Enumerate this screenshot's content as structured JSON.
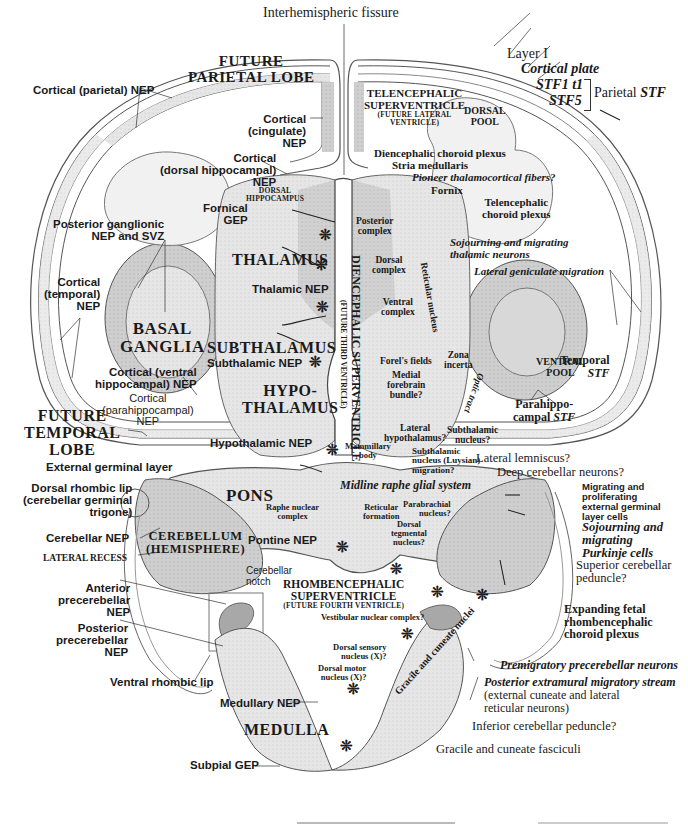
{
  "figure": {
    "top_label": "Interhemispheric fissure",
    "regions": {
      "future_parietal_lobe": [
        "FUTURE",
        "PARIETAL LOBE"
      ],
      "future_temporal_lobe": [
        "FUTURE",
        "TEMPORAL",
        "LOBE"
      ],
      "telencephalic_superventricle": [
        "TELENCEPHALIC",
        "SUPERVENTRICLE",
        "(FUTURE LATERAL",
        "VENTRICLE)"
      ],
      "dorsal_pool": [
        "DORSAL",
        "POOL"
      ],
      "ventral_pool": [
        "VENTRAL",
        "POOL"
      ],
      "dorsal_hippocampus": [
        "DORSAL",
        "HIPPOCAMPUS"
      ],
      "thalamus": "THALAMUS",
      "subthalamus": "SUBTHALAMUS",
      "hypothalamus": [
        "HYPO-",
        "THALAMUS"
      ],
      "basal_ganglia": [
        "BASAL",
        "GANGLIA"
      ],
      "diencephalic_superventricle": [
        "DIENCEPHALIC SUPERVENTRICLE",
        "(FUTURE THIRD VENTRICLE)"
      ],
      "pons": "PONS",
      "cerebellum": [
        "CEREBELLUM",
        "(HEMISPHERE)"
      ],
      "rhombencephalic_superventricle": [
        "RHOMBENCEPHALIC",
        "SUPERVENTRICLE",
        "(FUTURE FOURTH VENTRICLE)"
      ],
      "medulla": "MEDULLA"
    },
    "left_labels": {
      "cortical_parietal_nep": "Cortical (parietal) NEP",
      "cortical_cingulate_nep": [
        "Cortical",
        "(cingulate)",
        "NEP"
      ],
      "cortical_dorsal_hippocampal_nep": [
        "Cortical",
        "(dorsal hippocampal)",
        "NEP"
      ],
      "fornical_gep": [
        "Fornical",
        "GEP"
      ],
      "posterior_ganglionic": [
        "Posterior ganglionic",
        "NEP and SVZ"
      ],
      "cortical_temporal_nep": [
        "Cortical",
        "(temporal)",
        "NEP"
      ],
      "thalamic_nep": "Thalamic NEP",
      "subthalamic_nep": "Subthalamic NEP",
      "cortical_ventral_hippocampal_nep": [
        "Cortical (ventral",
        "hippocampal) NEP"
      ],
      "cortical_parahippocampal_nep": [
        "Cortical",
        "(parahippocampal)",
        "NEP"
      ],
      "hypothalamic_nep": "Hypothalamic NEP",
      "external_germinal_layer": "External germinal layer",
      "dorsal_rhombic_lip": [
        "Dorsal rhombic lip",
        "(cerebellar germinal",
        "trigone)"
      ],
      "cerebellar_nep": "Cerebellar NEP",
      "lateral_recess": "LATERAL RECESS",
      "anterior_precerebellar_nep": [
        "Anterior",
        "precerebellar",
        "NEP"
      ],
      "posterior_precerebellar_nep": [
        "Posterior",
        "precerebellar",
        "NEP"
      ],
      "ventral_rhombic_lip": "Ventral rhombic lip",
      "medullary_nep": "Medullary NEP",
      "subpial_gep": "Subpial GEP",
      "pontine_nep": "Pontine NEP",
      "cerebellar_notch": [
        "Cerebellar",
        "notch"
      ]
    },
    "right_labels": {
      "layer_i": "Layer I",
      "cortical_plate": "Cortical plate",
      "stf1_t1": "STF1 t1",
      "stf5": "STF5",
      "parietal_stf_prefix": "Parietal ",
      "parietal_stf_suffix": "STF",
      "diencephalic_choroid_plexus": "Diencephalic choroid plexus",
      "stria_medullaris": "Stria medullaris",
      "pioneer_fibers": "Pioneer thalamocortical fibers?",
      "fornix": "Fornix",
      "telencephalic_choroid_plexus": [
        "Telencephalic",
        "choroid plexus"
      ],
      "posterior_complex": [
        "Posterior",
        "complex"
      ],
      "dorsal_complex": [
        "Dorsal",
        "complex"
      ],
      "ventral_complex": [
        "Ventral",
        "complex"
      ],
      "reticular_nucleus": "Reticular nucleus",
      "sojourning_thalamic": [
        "Sojourning and migrating",
        "thalamic neurons"
      ],
      "lateral_geniculate_migration": "Lateral geniculate migration",
      "forels_fields": "Forel's fields",
      "zona_incerta": [
        "Zona",
        "incerta"
      ],
      "optic_tract": "Optic tract",
      "medial_forebrain_bundle": [
        "Medial",
        "forebrain",
        "bundle?"
      ],
      "lateral_hypothalamus": [
        "Lateral",
        "hypothalamus?"
      ],
      "subthalamic_nucleus": [
        "Subthalamic",
        "nucleus?"
      ],
      "mammillary_body": [
        "Mammillary",
        "body"
      ],
      "subthalamic_migration": [
        "Subthalamic",
        "nucleus (Luysian)",
        "migration?"
      ],
      "temporal_stf": [
        "Temporal",
        "STF"
      ],
      "parahippocampal_stf": [
        "Parahippo-",
        "campal ",
        "STF"
      ],
      "lateral_lemniscus": "Lateral lemniscus?",
      "deep_cerebellar_neurons": "Deep cerebellar neurons?",
      "midline_raphe": "Midline raphe glial system",
      "raphe_nuclear_complex": [
        "Raphe nuclear",
        "complex"
      ],
      "reticular_formation": [
        "Reticular",
        "formation"
      ],
      "parabrachial_nucleus": [
        "Parabrachial",
        "nucleus?"
      ],
      "dorsal_tegmental_nucleus": [
        "Dorsal",
        "tegmental",
        "nucleus?"
      ],
      "migrating_egl_cells": [
        "Migrating and",
        "proliferating",
        "external germinal",
        "layer cells"
      ],
      "sojourning_purkinje": [
        "Sojourning and",
        "migrating",
        "Purkinje cells"
      ],
      "superior_cerebellar_peduncle": [
        "Superior cerebellar",
        "peduncle?"
      ],
      "expanding_choroid_plexus": [
        "Expanding fetal",
        "rhombencephalic",
        "choroid plexus"
      ],
      "vestibular_nuclear_complex": "Vestibular nuclear complex?",
      "dorsal_sensory_nucleus": [
        "Dorsal sensory",
        "nucleus (X)?"
      ],
      "dorsal_motor_nucleus": [
        "Dorsal motor",
        "nucleus (X)?"
      ],
      "premigratory_precerebellar": "Premigratory precerebellar neurons",
      "posterior_extramural_stream": "Posterior extramural migratory stream",
      "posterior_extramural_detail": [
        "(external cuneate and lateral",
        "reticular neurons)"
      ],
      "gracile_cuneate_nuclei": "Gracile and cuneate nuclei",
      "inferior_cerebellar_peduncle": "Inferior cerebellar peduncle?",
      "gracile_cuneate_fasciculi": "Gracile and cuneate fasciculi"
    },
    "colors": {
      "line": "#2a2a2a",
      "tissue_light": "#e9e9e9",
      "tissue_mid": "#c9c9c9",
      "tissue_dark": "#a8a8a8",
      "background": "#ffffff"
    },
    "glyphs": {
      "asterisk": "❊",
      "arrow": "⇚"
    }
  }
}
